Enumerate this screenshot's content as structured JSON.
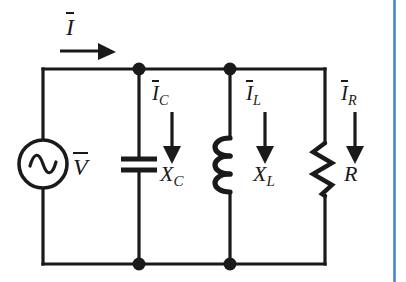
{
  "diagram": {
    "type": "electrical-schematic",
    "background_color": "#ffffff",
    "line_color": "#1a1a1a",
    "accent_rule_color": "#4a86c8",
    "labels": {
      "source_current": {
        "symbol": "I",
        "overbar": true,
        "subscript": "",
        "text": "I"
      },
      "source_voltage": {
        "symbol": "V",
        "overbar": true,
        "subscript": "",
        "text": "V"
      },
      "capacitor_current": {
        "symbol": "I",
        "overbar": true,
        "subscript": "C",
        "text": "I"
      },
      "capacitor_reactance": {
        "symbol": "X",
        "overbar": false,
        "subscript": "C",
        "text": "X"
      },
      "inductor_current": {
        "symbol": "I",
        "overbar": true,
        "subscript": "L",
        "text": "I"
      },
      "inductor_reactance": {
        "symbol": "X",
        "overbar": false,
        "subscript": "L",
        "text": "X"
      },
      "resistor_current": {
        "symbol": "I",
        "overbar": true,
        "subscript": "R",
        "text": "I"
      },
      "resistance": {
        "symbol": "R",
        "overbar": false,
        "subscript": "",
        "text": "R"
      }
    },
    "components": [
      {
        "name": "ac-voltage-source",
        "symbol": "circle-with-sine",
        "label": "V"
      },
      {
        "name": "capacitor",
        "symbol": "two-parallel-plates",
        "label": "X_C"
      },
      {
        "name": "inductor",
        "symbol": "coil-three-loops",
        "label": "X_L"
      },
      {
        "name": "resistor",
        "symbol": "zigzag",
        "label": "R"
      }
    ],
    "nodes": [
      {
        "name": "top-node-capacitor",
        "x": 139,
        "y": 69
      },
      {
        "name": "top-node-inductor",
        "x": 230,
        "y": 69
      },
      {
        "name": "bottom-node-capacitor",
        "x": 139,
        "y": 264
      },
      {
        "name": "bottom-node-inductor",
        "x": 230,
        "y": 264
      }
    ],
    "current_arrows": [
      {
        "name": "source-current-arrow",
        "direction": "right"
      },
      {
        "name": "capacitor-current-arrow",
        "direction": "down"
      },
      {
        "name": "inductor-current-arrow",
        "direction": "down"
      },
      {
        "name": "resistor-current-arrow",
        "direction": "down"
      }
    ]
  }
}
